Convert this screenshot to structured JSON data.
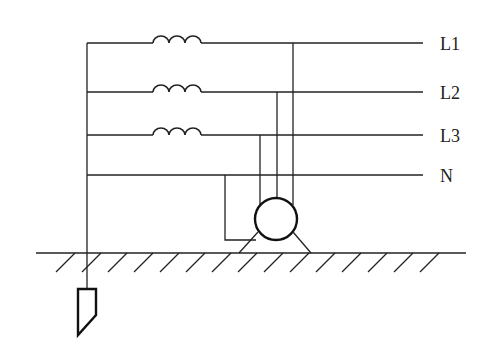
{
  "diagram": {
    "type": "electrical-schematic",
    "lines": [
      {
        "id": "L1",
        "label": "L1",
        "has_inductor": true
      },
      {
        "id": "L2",
        "label": "L2",
        "has_inductor": true
      },
      {
        "id": "L3",
        "label": "L3",
        "has_inductor": true
      },
      {
        "id": "N",
        "label": "N",
        "has_inductor": false
      }
    ],
    "components": [
      "motor",
      "ground-surface",
      "ground-electrode"
    ],
    "colors": {
      "stroke": "#222222",
      "background": "#ffffff"
    }
  }
}
